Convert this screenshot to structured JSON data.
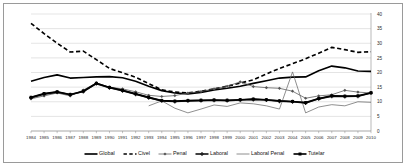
{
  "chart_data": {
    "type": "line",
    "title": "",
    "xlabel": "",
    "ylabel": "",
    "ylim": [
      0,
      40
    ],
    "ytick_labels": [
      "0",
      "5",
      "10",
      "15",
      "20",
      "25",
      "30",
      "35",
      "40"
    ],
    "ytick_values": [
      0,
      5,
      10,
      15,
      20,
      25,
      30,
      35,
      40
    ],
    "grid": true,
    "grid_axis": "y",
    "y_axis_position": "right",
    "legend_position": "bottom",
    "categories": [
      "1984",
      "1985",
      "1986",
      "1987",
      "1988",
      "1989",
      "1990",
      "1991",
      "1992",
      "1993",
      "1994",
      "1995",
      "1996",
      "1997",
      "1998",
      "1999",
      "2000",
      "2001",
      "2002",
      "2003",
      "2004",
      "2005",
      "2006",
      "2007",
      "2008",
      "2009",
      "2010"
    ],
    "series": [
      {
        "name": "Global",
        "style": "solid-thick",
        "marker": "none",
        "color": "#000000",
        "values": [
          17.0,
          18.3,
          19.2,
          18.1,
          18.3,
          18.5,
          18.6,
          18.2,
          17.0,
          15.3,
          13.8,
          13.0,
          12.7,
          13.2,
          14.0,
          14.6,
          15.3,
          16.3,
          17.2,
          18.1,
          18.4,
          18.5,
          20.6,
          22.2,
          21.6,
          20.5,
          20.4
        ]
      },
      {
        "name": "Civel",
        "style": "dashed-thick",
        "marker": "none",
        "color": "#000000",
        "values": [
          36.8,
          33.3,
          30.0,
          27.0,
          27.3,
          24.4,
          21.4,
          19.9,
          18.4,
          16.2,
          14.1,
          13.3,
          13.0,
          13.6,
          14.4,
          15.3,
          16.4,
          17.5,
          19.5,
          21.4,
          23.0,
          24.7,
          26.6,
          28.6,
          27.8,
          26.9,
          27.1
        ]
      },
      {
        "name": "Penal",
        "style": "solid-thin",
        "marker": "diamond",
        "color": "#555555",
        "values": [
          11.0,
          12.0,
          13.0,
          12.0,
          14.0,
          16.4,
          15.0,
          14.4,
          13.4,
          12.2,
          11.8,
          12.1,
          13.0,
          13.5,
          14.4,
          15.3,
          16.8,
          15.2,
          14.8,
          14.6,
          13.6,
          11.2,
          12.0,
          12.4,
          13.9,
          13.3,
          13.0
        ]
      },
      {
        "name": "Laboral",
        "style": "solid-thick",
        "marker": "cross",
        "color": "#1a1a1a",
        "values": [
          11.4,
          12.6,
          13.3,
          12.4,
          13.5,
          16.2,
          14.8,
          13.8,
          12.6,
          11.4,
          10.3,
          10.1,
          10.3,
          10.4,
          10.5,
          10.4,
          10.6,
          10.8,
          10.6,
          10.2,
          10.0,
          9.6,
          11.0,
          11.9,
          11.8,
          11.9,
          13.0
        ]
      },
      {
        "name": "Laboral Penal",
        "style": "solid-thin",
        "marker": "none",
        "color": "#6a6a6a",
        "values": [
          null,
          null,
          null,
          null,
          null,
          null,
          null,
          null,
          null,
          8.6,
          10.3,
          7.8,
          6.2,
          7.5,
          8.9,
          8.4,
          9.6,
          9.3,
          8.6,
          7.5,
          20.2,
          6.2,
          8.2,
          9.0,
          8.6,
          10.0,
          9.8
        ]
      },
      {
        "name": "Tutelar",
        "style": "solid-thick",
        "marker": "square",
        "color": "#000000",
        "values": [
          11.5,
          12.8,
          13.4,
          12.5,
          13.6,
          16.3,
          14.9,
          13.9,
          12.7,
          11.5,
          10.4,
          10.2,
          10.4,
          10.5,
          10.6,
          10.5,
          10.7,
          10.9,
          10.7,
          10.3,
          10.1,
          9.7,
          11.1,
          12.0,
          11.9,
          12.0,
          13.1
        ]
      }
    ]
  },
  "legend": {
    "items": [
      {
        "label": "Global"
      },
      {
        "label": "Civel"
      },
      {
        "label": "Penal"
      },
      {
        "label": "Laboral"
      },
      {
        "label": "Laboral Penal"
      },
      {
        "label": "Tutelar"
      }
    ]
  }
}
